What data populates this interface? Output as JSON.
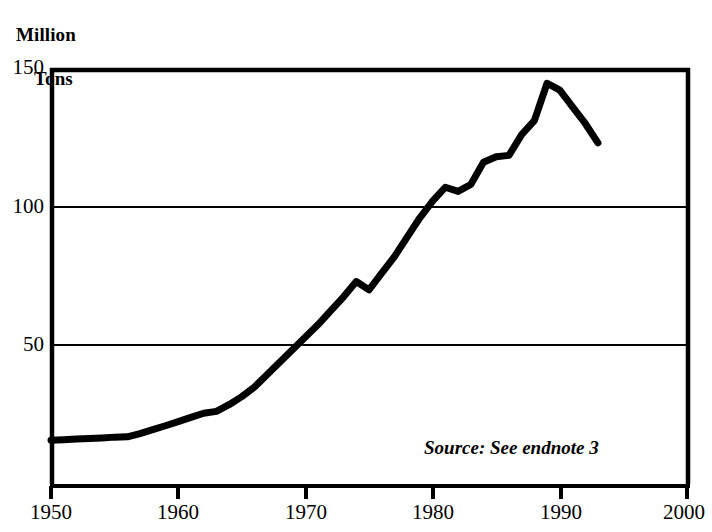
{
  "chart_data": {
    "type": "line",
    "title": "",
    "ylabel": "Million Tons",
    "ylabel_lines": [
      "Million",
      "Tons"
    ],
    "xlabel": "",
    "xlim": [
      1950,
      2000
    ],
    "ylim": [
      0,
      150
    ],
    "yticks": [
      50,
      100,
      150
    ],
    "ytick_labels": [
      "50",
      "100",
      "150"
    ],
    "xticks": [
      1950,
      1960,
      1970,
      1980,
      1990,
      2000
    ],
    "xtick_labels": [
      "1950",
      "1960",
      "1970",
      "1980",
      "1990",
      "2000"
    ],
    "grid": "horizontal",
    "legend": "none",
    "annotation": "Source: See endnote 3",
    "line_color": "#000000",
    "line_width_px": 7,
    "frame_color": "#000000",
    "background": "#ffffff",
    "series": [
      {
        "name": "Million Tons",
        "x": [
          1950,
          1951,
          1952,
          1953,
          1954,
          1955,
          1956,
          1957,
          1958,
          1959,
          1960,
          1961,
          1962,
          1963,
          1964,
          1965,
          1966,
          1967,
          1968,
          1969,
          1970,
          1971,
          1972,
          1973,
          1974,
          1975,
          1976,
          1977,
          1978,
          1979,
          1980,
          1981,
          1982,
          1983,
          1984,
          1985,
          1986,
          1987,
          1988,
          1989,
          1990,
          1991,
          1992,
          1993
        ],
        "values": [
          15.8,
          16.0,
          16.2,
          16.4,
          16.6,
          16.9,
          17.0,
          18.2,
          19.6,
          21.0,
          22.5,
          24.0,
          25.5,
          26.2,
          28.6,
          31.5,
          35.0,
          39.5,
          44.0,
          48.5,
          53.0,
          57.5,
          62.5,
          67.5,
          73.0,
          70.0,
          76.0,
          82.0,
          89.0,
          96.0,
          102.0,
          107.0,
          105.5,
          108.0,
          116.0,
          118.0,
          118.5,
          126.0,
          131.0,
          144.5,
          142.0,
          136.0,
          130.0,
          123.0
        ]
      }
    ]
  },
  "annotations": {
    "source": "Source: See endnote 3"
  }
}
